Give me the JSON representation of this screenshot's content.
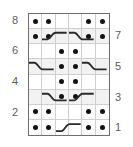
{
  "chart_data": {
    "type": "table",
    "columns": 6,
    "rows": 8,
    "xlabel": "",
    "ylabel": "",
    "legend": [],
    "row_labels_left": [
      "8",
      "",
      "6",
      "",
      "4",
      "",
      "2",
      ""
    ],
    "row_labels_right": [
      "",
      "7",
      "",
      "5",
      "",
      "3",
      "",
      "1"
    ],
    "symbols": {
      "dot": "purl-dot",
      "cable_rise": "cable-rising-line",
      "cable_fall": "cable-falling-line",
      "empty": "blank-knit"
    },
    "colors": {
      "dot": "#121212",
      "grid_line": "#cfcfcf",
      "border": "#6e6e6e",
      "cell_bg": "#ffffff",
      "cell_shade": "#f2f2f2",
      "label": "#5d5d5d",
      "cable_line": "#2b2b2b"
    },
    "grid_rows": [
      {
        "row": 8,
        "label_left": "8",
        "label_right": "",
        "shaded": false,
        "cells": [
          "dot",
          "dot",
          "empty",
          "empty",
          "dot",
          "dot"
        ],
        "cables": []
      },
      {
        "row": 7,
        "label_left": "",
        "label_right": "7",
        "shaded": true,
        "cells": [
          "dot",
          "dot",
          "empty",
          "empty",
          "dot",
          "dot"
        ],
        "cables": [
          {
            "start_col": 2,
            "span": 2,
            "direction": "rise"
          },
          {
            "start_col": 4,
            "span": 2,
            "direction": "fall"
          }
        ]
      },
      {
        "row": 6,
        "label_left": "6",
        "label_right": "",
        "shaded": false,
        "cells": [
          "empty",
          "empty",
          "dot",
          "dot",
          "empty",
          "empty"
        ],
        "cables": []
      },
      {
        "row": 5,
        "label_left": "",
        "label_right": "5",
        "shaded": true,
        "cells": [
          "empty",
          "empty",
          "dot",
          "dot",
          "empty",
          "empty"
        ],
        "cables": [
          {
            "start_col": 1,
            "span": 2,
            "direction": "fall"
          },
          {
            "start_col": 5,
            "span": 2,
            "direction": "fall"
          }
        ]
      },
      {
        "row": 4,
        "label_left": "4",
        "label_right": "",
        "shaded": false,
        "cells": [
          "empty",
          "empty",
          "dot",
          "dot",
          "empty",
          "empty"
        ],
        "cables": []
      },
      {
        "row": 3,
        "label_left": "",
        "label_right": "3",
        "shaded": true,
        "cells": [
          "empty",
          "empty",
          "dot",
          "dot",
          "empty",
          "empty"
        ],
        "cables": [
          {
            "start_col": 2,
            "span": 2,
            "direction": "fall"
          },
          {
            "start_col": 4,
            "span": 2,
            "direction": "rise"
          }
        ]
      },
      {
        "row": 2,
        "label_left": "2",
        "label_right": "",
        "shaded": false,
        "cells": [
          "dot",
          "dot",
          "empty",
          "empty",
          "dot",
          "dot"
        ],
        "cables": []
      },
      {
        "row": 1,
        "label_left": "",
        "label_right": "1",
        "shaded": false,
        "cells": [
          "dot",
          "dot",
          "empty",
          "empty",
          "dot",
          "dot"
        ],
        "cables": [
          {
            "start_col": 3,
            "span": 2,
            "direction": "rise"
          }
        ]
      }
    ]
  }
}
